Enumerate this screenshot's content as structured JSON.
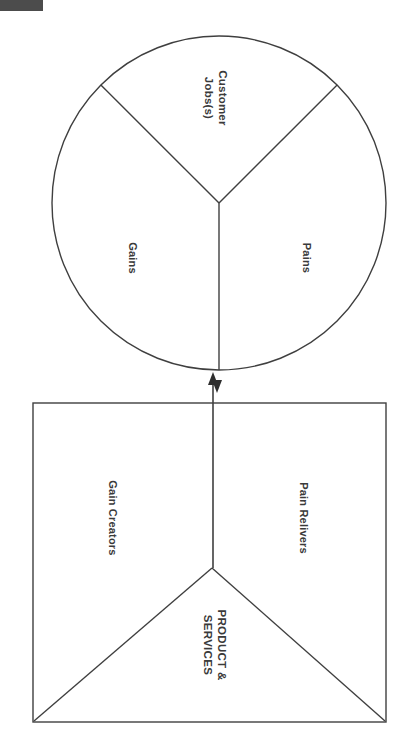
{
  "page": {
    "width": 404,
    "height": 737,
    "background_color": "#ffffff",
    "stroke_color": "#3f3f3f",
    "text_color": "#3a3a3a",
    "orientation_note": "content rendered rotated 90 degrees"
  },
  "corner_mark": {
    "name": "top-left-gray-bar",
    "color": "#4c4c4c",
    "x": 0,
    "y": 0,
    "width": 43,
    "height": 11
  },
  "customer_profile": {
    "shape": "circle",
    "center_x": 219,
    "center_y": 203,
    "radius": 167,
    "segments": [
      {
        "key": "customer_jobs",
        "label": "Customer\nJobs(s)",
        "label_x": 216,
        "label_y": 98
      },
      {
        "key": "gains",
        "label": "Gains",
        "label_x": 132,
        "label_y": 258
      },
      {
        "key": "pains",
        "label": "Pains",
        "label_x": 306,
        "label_y": 258
      }
    ]
  },
  "value_map": {
    "shape": "square",
    "x": 33,
    "y": 403,
    "width": 353,
    "height": 319,
    "apex_x": 212,
    "apex_y": 568,
    "segments": [
      {
        "key": "gain_creators",
        "label": "Gain Creators",
        "label_x": 112,
        "label_y": 518
      },
      {
        "key": "pain_relievers",
        "label": "Pain Relivers",
        "label_x": 303,
        "label_y": 518
      },
      {
        "key": "product_services",
        "label": "PRODUCT &\nSERVICES",
        "label_x": 215,
        "label_y": 645
      }
    ]
  },
  "connector": {
    "name": "fit-arrow",
    "description": "double-headed vertical arrow linking value map to customer profile",
    "x": 217,
    "top_y": 371,
    "bottom_y": 568,
    "arrow_up_tip_y": 373,
    "arrow_down_tip_y": 395
  }
}
